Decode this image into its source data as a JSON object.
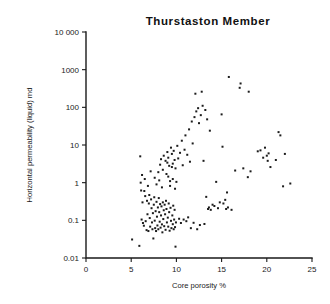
{
  "figure": {
    "title": "Thurstaston Member",
    "background_color": "#ffffff",
    "axis_color": "#1a1a1a",
    "point_color": "#1c1c1c"
  },
  "chart_data": {
    "type": "scatter",
    "title": "Thurstaston Member",
    "xlabel": "Core porosity %",
    "ylabel": "Horizontal permeability (liquid) md",
    "xscale": "linear",
    "yscale": "log",
    "xlim": [
      0,
      25
    ],
    "ylim": [
      0.01,
      10000
    ],
    "grid": false,
    "legend": null,
    "xticks": [
      0,
      5,
      10,
      15,
      20,
      25
    ],
    "xtick_labels": [
      "0",
      "5",
      "10",
      "15",
      "20",
      "25"
    ],
    "yticks": [
      0.01,
      0.1,
      1,
      10,
      100,
      1000,
      10000
    ],
    "ytick_labels": [
      "0.01",
      "0.1",
      "1",
      "10",
      "100",
      "1000",
      "10 000"
    ],
    "marker": "square",
    "marker_size": 2,
    "n_points": 171,
    "points": [
      [
        5.1,
        0.031
      ],
      [
        5.9,
        0.021
      ],
      [
        6.0,
        5.0
      ],
      [
        6.05,
        1.0
      ],
      [
        6.1,
        0.62
      ],
      [
        6.15,
        0.105
      ],
      [
        6.2,
        1.6
      ],
      [
        6.25,
        0.3
      ],
      [
        6.3,
        0.085
      ],
      [
        6.4,
        0.072
      ],
      [
        6.45,
        0.6
      ],
      [
        6.5,
        1.25
      ],
      [
        6.55,
        0.44
      ],
      [
        6.6,
        0.095
      ],
      [
        6.7,
        0.055
      ],
      [
        6.75,
        0.33
      ],
      [
        6.8,
        0.145
      ],
      [
        6.85,
        0.82
      ],
      [
        6.9,
        0.052
      ],
      [
        6.95,
        0.28
      ],
      [
        7.0,
        0.47
      ],
      [
        7.05,
        0.115
      ],
      [
        7.1,
        0.068
      ],
      [
        7.15,
        2.0
      ],
      [
        7.2,
        0.36
      ],
      [
        7.25,
        0.21
      ],
      [
        7.3,
        0.088
      ],
      [
        7.35,
        0.058
      ],
      [
        7.4,
        0.155
      ],
      [
        7.45,
        0.033
      ],
      [
        7.5,
        0.26
      ],
      [
        7.55,
        0.41
      ],
      [
        7.6,
        0.098
      ],
      [
        7.65,
        0.062
      ],
      [
        7.7,
        0.175
      ],
      [
        7.75,
        0.052
      ],
      [
        7.8,
        0.31
      ],
      [
        7.85,
        0.125
      ],
      [
        7.9,
        0.073
      ],
      [
        7.95,
        0.22
      ],
      [
        8.0,
        0.058
      ],
      [
        8.05,
        0.39
      ],
      [
        8.1,
        0.165
      ],
      [
        8.15,
        0.092
      ],
      [
        8.2,
        0.27
      ],
      [
        8.25,
        0.064
      ],
      [
        8.3,
        0.135
      ],
      [
        8.35,
        0.235
      ],
      [
        8.4,
        0.078
      ],
      [
        8.45,
        0.048
      ],
      [
        8.5,
        0.3
      ],
      [
        8.55,
        0.108
      ],
      [
        8.6,
        0.185
      ],
      [
        8.65,
        0.07
      ],
      [
        8.7,
        0.26
      ],
      [
        8.75,
        0.145
      ],
      [
        8.8,
        0.056
      ],
      [
        8.85,
        0.33
      ],
      [
        8.9,
        0.2
      ],
      [
        8.95,
        0.088
      ],
      [
        9.0,
        3.4
      ],
      [
        9.05,
        0.118
      ],
      [
        9.1,
        0.068
      ],
      [
        9.15,
        0.28
      ],
      [
        9.2,
        0.165
      ],
      [
        9.25,
        0.053
      ],
      [
        9.3,
        1.1
      ],
      [
        9.35,
        0.215
      ],
      [
        9.4,
        0.097
      ],
      [
        9.45,
        0.062
      ],
      [
        9.5,
        2.6
      ],
      [
        9.55,
        0.135
      ],
      [
        9.6,
        0.079
      ],
      [
        9.65,
        0.245
      ],
      [
        9.7,
        0.058
      ],
      [
        9.75,
        0.105
      ],
      [
        9.8,
        0.19
      ],
      [
        9.85,
        0.066
      ],
      [
        9.9,
        0.02
      ],
      [
        9.95,
        0.088
      ],
      [
        8.2,
        3.0
      ],
      [
        8.3,
        4.2
      ],
      [
        8.5,
        2.2
      ],
      [
        8.6,
        5.2
      ],
      [
        8.8,
        3.8
      ],
      [
        8.9,
        1.7
      ],
      [
        9.0,
        6.5
      ],
      [
        9.1,
        4.6
      ],
      [
        9.2,
        2.8
      ],
      [
        9.4,
        8.5
      ],
      [
        9.5,
        5.8
      ],
      [
        9.6,
        3.2
      ],
      [
        9.7,
        7.0
      ],
      [
        9.8,
        4.0
      ],
      [
        9.9,
        2.4
      ],
      [
        7.6,
        1.35
      ],
      [
        7.8,
        0.9
      ],
      [
        8.0,
        1.9
      ],
      [
        8.1,
        1.15
      ],
      [
        8.4,
        0.75
      ],
      [
        9.1,
        1.45
      ],
      [
        9.3,
        0.82
      ],
      [
        9.6,
        1.25
      ],
      [
        9.85,
        0.69
      ],
      [
        10.0,
        1.05
      ],
      [
        10.1,
        9.5
      ],
      [
        10.2,
        4.4
      ],
      [
        10.3,
        0.11
      ],
      [
        10.4,
        6.2
      ],
      [
        10.5,
        0.085
      ],
      [
        10.6,
        13.0
      ],
      [
        10.7,
        2.9
      ],
      [
        10.8,
        0.105
      ],
      [
        10.9,
        7.5
      ],
      [
        11.0,
        18.0
      ],
      [
        11.1,
        0.095
      ],
      [
        11.2,
        5.5
      ],
      [
        11.3,
        0.12
      ],
      [
        11.4,
        26.0
      ],
      [
        11.5,
        3.6
      ],
      [
        11.6,
        0.062
      ],
      [
        11.7,
        42.0
      ],
      [
        11.8,
        11.0
      ],
      [
        11.9,
        0.086
      ],
      [
        12.0,
        55.0
      ],
      [
        12.1,
        230.0
      ],
      [
        12.2,
        78.0
      ],
      [
        12.3,
        0.058
      ],
      [
        12.4,
        95.0
      ],
      [
        12.5,
        38.0
      ],
      [
        12.6,
        0.075
      ],
      [
        12.7,
        62.0
      ],
      [
        12.8,
        260.0
      ],
      [
        12.9,
        110.0
      ],
      [
        13.0,
        3.8
      ],
      [
        13.1,
        0.08
      ],
      [
        13.2,
        85.0
      ],
      [
        13.3,
        0.42
      ],
      [
        13.4,
        48.0
      ],
      [
        13.5,
        0.2
      ],
      [
        13.6,
        0.22
      ],
      [
        13.7,
        24.0
      ],
      [
        13.8,
        0.19
      ],
      [
        14.0,
        0.26
      ],
      [
        14.2,
        0.24
      ],
      [
        14.4,
        1.05
      ],
      [
        14.6,
        0.21
      ],
      [
        14.8,
        0.3
      ],
      [
        15.0,
        65.0
      ],
      [
        15.1,
        9.0
      ],
      [
        15.2,
        0.28
      ],
      [
        15.4,
        0.35
      ],
      [
        15.5,
        0.2
      ],
      [
        15.6,
        0.55
      ],
      [
        15.7,
        0.22
      ],
      [
        15.8,
        640.0
      ],
      [
        16.1,
        0.19
      ],
      [
        16.5,
        2.1
      ],
      [
        17.0,
        330.0
      ],
      [
        17.1,
        430.0
      ],
      [
        17.4,
        2.4
      ],
      [
        17.9,
        1.4
      ],
      [
        18.0,
        260.0
      ],
      [
        18.2,
        2.0
      ],
      [
        19.0,
        6.8
      ],
      [
        19.3,
        7.2
      ],
      [
        19.6,
        4.6
      ],
      [
        19.8,
        8.5
      ],
      [
        20.0,
        5.2
      ],
      [
        20.1,
        3.8
      ],
      [
        20.2,
        6.0
      ],
      [
        20.4,
        2.6
      ],
      [
        21.0,
        4.0
      ],
      [
        21.3,
        22.0
      ],
      [
        21.5,
        18.0
      ],
      [
        21.8,
        0.8
      ],
      [
        22.0,
        5.8
      ],
      [
        22.6,
        0.95
      ]
    ]
  },
  "axes": {
    "x_axis_title": "Core porosity %",
    "y_axis_title": "Horizontal permeability (liquid) md"
  }
}
